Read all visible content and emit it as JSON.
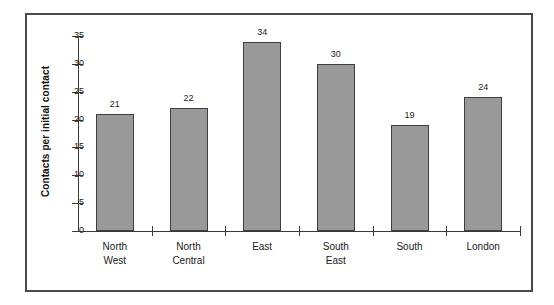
{
  "chart_data": {
    "type": "bar",
    "title": "",
    "xlabel": "",
    "ylabel": "Contacts per initial contact",
    "categories": [
      "North West",
      "North Central",
      "East",
      "South East",
      "South",
      "London"
    ],
    "category_lines": [
      [
        "North",
        "West"
      ],
      [
        "North",
        "Central"
      ],
      [
        "East",
        ""
      ],
      [
        "South",
        "East"
      ],
      [
        "South",
        ""
      ],
      [
        "London",
        ""
      ]
    ],
    "values": [
      21,
      22,
      34,
      30,
      19,
      24
    ],
    "value_labels": [
      "21",
      "22",
      "34",
      "30",
      "19",
      "24"
    ],
    "ylim": [
      0,
      35
    ],
    "ytick_labels": [
      "0",
      "5",
      "10",
      "15",
      "20",
      "25",
      "30",
      "35"
    ],
    "ytick_values": [
      0,
      5,
      10,
      15,
      20,
      25,
      30,
      35
    ],
    "grid": false,
    "legend": false,
    "bar_color": "#999999",
    "bar_border_color": "#3f3f3f",
    "axis_color": "#3a3a3a",
    "frame_color": "#4a4a4a",
    "background": "#ffffff"
  }
}
